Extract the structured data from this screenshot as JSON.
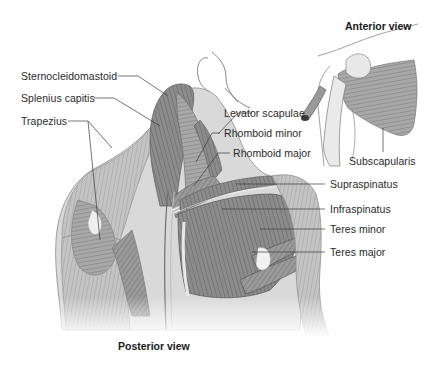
{
  "figure": {
    "type": "anatomical-illustration",
    "background": "#ffffff",
    "ink_color": "#2a2a2a",
    "muscle_shade": "#8a8a8a"
  },
  "views": {
    "posterior": {
      "title": "Posterior view"
    },
    "anterior": {
      "title": "Anterior view"
    }
  },
  "labels": {
    "left": [
      {
        "id": "sternocleidomastoid",
        "text": "Sternocleidomastoid"
      },
      {
        "id": "splenius-capitis",
        "text": "Splenius capitis"
      },
      {
        "id": "trapezius",
        "text": "Trapezius"
      }
    ],
    "right": [
      {
        "id": "levator-scapulae",
        "text": "Levator scapulae"
      },
      {
        "id": "rhomboid-minor",
        "text": "Rhomboid minor"
      },
      {
        "id": "rhomboid-major",
        "text": "Rhomboid major"
      },
      {
        "id": "supraspinatus",
        "text": "Supraspinatus"
      },
      {
        "id": "infraspinatus",
        "text": "Infraspinatus"
      },
      {
        "id": "teres-minor",
        "text": "Teres minor"
      },
      {
        "id": "teres-major",
        "text": "Teres major"
      }
    ],
    "anterior": [
      {
        "id": "subscapularis",
        "text": "Subscapularis"
      }
    ]
  }
}
